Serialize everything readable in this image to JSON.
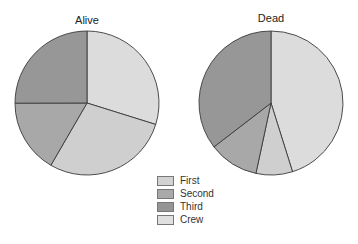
{
  "chart_data": [
    {
      "type": "pie",
      "title": "Alive",
      "categories": [
        "Crew",
        "First",
        "Second",
        "Third"
      ],
      "values": [
        212,
        203,
        118,
        178
      ],
      "percent": [
        29.8,
        28.6,
        16.6,
        25.0
      ],
      "start_angle": "12 o'clock, clockwise"
    },
    {
      "type": "pie",
      "title": "Dead",
      "categories": [
        "Crew",
        "First",
        "Second",
        "Third"
      ],
      "values": [
        673,
        122,
        167,
        528
      ],
      "percent": [
        45.2,
        8.2,
        11.2,
        35.4
      ],
      "start_angle": "12 o'clock, clockwise"
    }
  ],
  "titles": {
    "alive": "Alive",
    "dead": "Dead"
  },
  "legend": [
    {
      "label": "First",
      "color": "#d2d2d2"
    },
    {
      "label": "Second",
      "color": "#a9a9a9"
    },
    {
      "label": "Third",
      "color": "#959595"
    },
    {
      "label": "Crew",
      "color": "#e0e0e0"
    }
  ],
  "colors": {
    "Crew": "#dcdcdc",
    "First": "#cfcfcf",
    "Second": "#a8a8a8",
    "Third": "#979797",
    "stroke": "#3a3a3a"
  }
}
